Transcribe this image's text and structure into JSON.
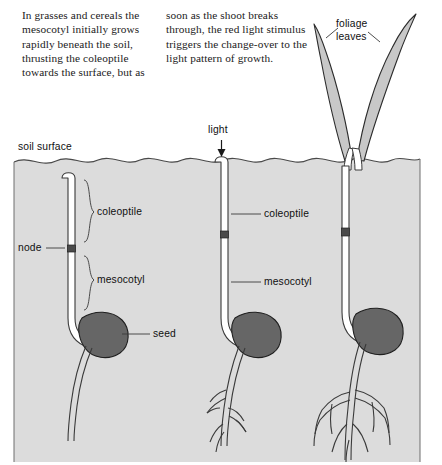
{
  "figure": {
    "width": 442,
    "height": 465
  },
  "caption": {
    "left_column": "In grasses and cereals the mesocotyl initially grows rapidly beneath the soil, thrusting the coleoptile towards the surface, but as",
    "right_column": "soon as the shoot breaks through, the red light stimulus triggers the change-over to the light pattern of growth."
  },
  "labels": {
    "soil_surface": "soil surface",
    "light": "light",
    "foliage_leaves_line1": "foliage",
    "foliage_leaves_line2": "leaves",
    "coleoptile_left": "coleoptile",
    "coleoptile_middle": "coleoptile",
    "node": "node",
    "mesocotyl_left": "mesocotyl",
    "mesocotyl_middle": "mesocotyl",
    "seed": "seed"
  },
  "stages": [
    {
      "name": "stage-1-underground",
      "description": "Seedling entirely beneath soil; coleoptile tip still below surface, long mesocotyl, single unbranched root.",
      "labels": [
        "coleoptile",
        "node",
        "mesocotyl",
        "seed"
      ]
    },
    {
      "name": "stage-2-emerging",
      "description": "Coleoptile tip has just broken through the soil surface and receives light; branched root system.",
      "labels": [
        "coleoptile",
        "mesocotyl",
        "light"
      ]
    },
    {
      "name": "stage-3-foliage",
      "description": "Foliage leaves have expanded above the soil; mesocotyl growth arrested; extensive branched roots.",
      "labels": [
        "foliage leaves"
      ]
    }
  ],
  "colors": {
    "soil_fill": "#dcdcdc",
    "soil_stroke": "#555555",
    "seed_fill": "#666666",
    "seed_stroke": "#222222",
    "shoot_fill": "#ffffff",
    "shoot_stroke": "#3a3a3a",
    "node_fill": "#4a4a4a",
    "leaf_fill": "#c8c8c8",
    "leaf_stroke": "#2b2b2b",
    "label_text": "#101010",
    "leader_line": "#3a3a3a"
  }
}
